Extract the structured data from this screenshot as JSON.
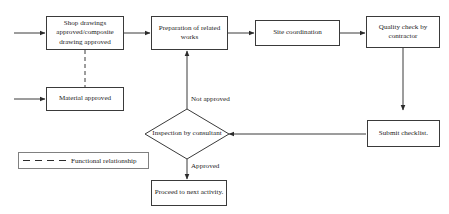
{
  "diagram": {
    "background_color": "#ffffff",
    "line_color": "#3a3a3a",
    "text_color": "#1c1c1c",
    "nodes": [
      {
        "id": "shop_drawings",
        "shape": "rectangle",
        "label": "Shop drawings approved/composite drawing approved"
      },
      {
        "id": "preparation",
        "shape": "rectangle",
        "label": "Preparation of related works"
      },
      {
        "id": "site_coordination",
        "shape": "rectangle",
        "label": "Site coordination"
      },
      {
        "id": "quality_check",
        "shape": "rectangle",
        "label": "Quality check by contractor"
      },
      {
        "id": "material_approved",
        "shape": "rectangle",
        "label": "Material approved"
      },
      {
        "id": "submit_checklist",
        "shape": "rectangle",
        "label": "Submit checklist."
      },
      {
        "id": "inspection",
        "shape": "diamond",
        "label": "Inspection by consultant"
      },
      {
        "id": "proceed",
        "shape": "rectangle",
        "label": "Proceed to next activity."
      }
    ],
    "edge_labels": {
      "not_approved": "Not approved",
      "approved": "Approved"
    },
    "legend": {
      "line_style": "dashed",
      "label": "Functional relationship"
    }
  }
}
